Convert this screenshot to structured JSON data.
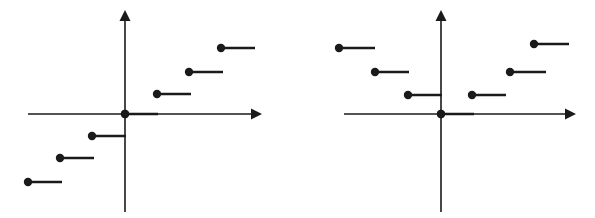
{
  "figure": {
    "background_color": "#ffffff",
    "stroke_color": "#1a1a1a",
    "width": 595,
    "height": 218,
    "panel_count": 2
  },
  "chart_data": [
    {
      "type": "line",
      "title": "",
      "subtitle": "",
      "xlabel": "",
      "ylabel": "",
      "description": "Step function resembling the floor / greatest-integer function: increasing staircase of half-open horizontal segments, each closed (filled dot) at its left endpoint and open at its right endpoint.",
      "grid": false,
      "legend": false,
      "legend_position": "none",
      "axes": {
        "x_axis": {
          "visible": true,
          "arrow_right": true,
          "arrow_left": false,
          "x_start_px": 28,
          "x_end_px": 262,
          "y_px": 114
        },
        "y_axis": {
          "visible": true,
          "arrow_up": true,
          "arrow_down": false,
          "x_px": 125,
          "y_start_px": 10,
          "y_end_px": 212
        },
        "origin_px": {
          "x": 125,
          "y": 114
        },
        "origin_dot": true,
        "xlim": [
          -3,
          4
        ],
        "ylim": [
          -3,
          4
        ],
        "step_width_px": 32,
        "step_height_px": 22
      },
      "x": [
        -3,
        -2,
        -1,
        0,
        1,
        2,
        3
      ],
      "values": [
        -3,
        -2,
        -1,
        0,
        1,
        2,
        3
      ],
      "steps": [
        {
          "x_start": -3,
          "x_end": -2,
          "y": -3,
          "closed_left": true,
          "open_right": true,
          "px": {
            "dot_x": 28,
            "dot_y": 182,
            "line_end_x": 62
          }
        },
        {
          "x_start": -2,
          "x_end": -1,
          "y": -2,
          "closed_left": true,
          "open_right": true,
          "px": {
            "dot_x": 60,
            "dot_y": 158,
            "line_end_x": 94
          }
        },
        {
          "x_start": -1,
          "x_end": 0,
          "y": -1,
          "closed_left": true,
          "open_right": true,
          "px": {
            "dot_x": 92,
            "dot_y": 136,
            "line_end_x": 126
          }
        },
        {
          "x_start": 0,
          "x_end": 1,
          "y": 0,
          "closed_left": true,
          "open_right": true,
          "px": {
            "dot_x": 125,
            "dot_y": 114,
            "line_end_x": 158
          }
        },
        {
          "x_start": 1,
          "x_end": 2,
          "y": 1,
          "closed_left": true,
          "open_right": true,
          "px": {
            "dot_x": 157,
            "dot_y": 94,
            "line_end_x": 191
          }
        },
        {
          "x_start": 2,
          "x_end": 3,
          "y": 2,
          "closed_left": true,
          "open_right": true,
          "px": {
            "dot_x": 189,
            "dot_y": 72,
            "line_end_x": 223
          }
        },
        {
          "x_start": 3,
          "x_end": 4,
          "y": 3,
          "closed_left": true,
          "open_right": true,
          "px": {
            "dot_x": 221,
            "dot_y": 48,
            "line_end_x": 255
          }
        }
      ]
    },
    {
      "type": "line",
      "title": "",
      "subtitle": "",
      "xlabel": "",
      "ylabel": "",
      "description": "Step function resembling the floor of the absolute value: V-shaped, symmetric about the y-axis, with a minimum segment at the origin and staircases rising on both sides.",
      "grid": false,
      "legend": false,
      "legend_position": "none",
      "axes": {
        "x_axis": {
          "visible": true,
          "arrow_right": true,
          "arrow_left": false,
          "x_start_px": 46,
          "x_end_px": 278,
          "y_px": 114
        },
        "y_axis": {
          "visible": true,
          "arrow_up": true,
          "arrow_down": false,
          "x_px": 143,
          "y_start_px": 10,
          "y_end_px": 212
        },
        "origin_px": {
          "x": 143,
          "y": 114
        },
        "origin_dot": true,
        "xlim": [
          -4,
          4
        ],
        "ylim": [
          -2,
          4
        ],
        "step_width_px": 32,
        "step_height_px": 22
      },
      "x": [
        -4,
        -3,
        -2,
        -1,
        0,
        1,
        2,
        3
      ],
      "values": [
        3,
        2,
        1,
        0,
        0,
        1,
        2,
        3
      ],
      "steps": [
        {
          "x_start": -4,
          "x_end": -3,
          "y": 3,
          "closed_left": true,
          "open_right": true,
          "px": {
            "dot_x": 41,
            "dot_y": 48,
            "line_end_x": 77
          }
        },
        {
          "x_start": -3,
          "x_end": -2,
          "y": 2,
          "closed_left": true,
          "open_right": true,
          "px": {
            "dot_x": 77,
            "dot_y": 72,
            "line_end_x": 111
          }
        },
        {
          "x_start": -2,
          "x_end": -1,
          "y": 1,
          "closed_left": true,
          "open_right": true,
          "px": {
            "dot_x": 110,
            "dot_y": 95,
            "line_end_x": 144
          }
        },
        {
          "x_start": -1,
          "x_end": 1,
          "y": 0,
          "closed_left": true,
          "open_right": true,
          "px": {
            "dot_x": 143,
            "dot_y": 114,
            "line_end_x": 176
          }
        },
        {
          "x_start": 1,
          "x_end": 2,
          "y": 1,
          "closed_left": true,
          "open_right": true,
          "px": {
            "dot_x": 174,
            "dot_y": 95,
            "line_end_x": 208
          }
        },
        {
          "x_start": 2,
          "x_end": 3,
          "y": 2,
          "closed_left": true,
          "open_right": true,
          "px": {
            "dot_x": 212,
            "dot_y": 72,
            "line_end_x": 248
          }
        },
        {
          "x_start": 3,
          "x_end": 4,
          "y": 3,
          "closed_left": true,
          "open_right": true,
          "px": {
            "dot_x": 236,
            "dot_y": 44,
            "line_end_x": 271
          }
        }
      ]
    }
  ]
}
